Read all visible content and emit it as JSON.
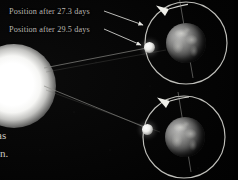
{
  "figure": {
    "name": "moon-sidereal-synodic-month-diagram",
    "background_color": "#050505",
    "labels": {
      "position_27": "Position after 27.3 days",
      "position_29": "Position after 29.5 days"
    },
    "body_text_fragments": {
      "line_1": "as",
      "line_2": "in."
    },
    "objects": {
      "sun_name": "sun",
      "earth_top_name": "earth-upper",
      "earth_bottom_name": "earth-lower",
      "moon_top_name": "moon-upper",
      "moon_bottom_name": "moon-lower",
      "orbit_top_name": "moon-orbit-upper",
      "orbit_bottom_name": "moon-orbit-lower",
      "axis_top_name": "earth-axis-upper",
      "axis_bottom_name": "earth-axis-lower"
    },
    "colors": {
      "sun": "#ffffff",
      "orbit_line": "#d8d8d4",
      "sun_ray": "#9a9a96",
      "label_text": "#b9b7b1",
      "leader_arrow": "#e6e6e2",
      "earth_body": "#6d6d6c"
    },
    "orbit_direction": "counterclockwise"
  }
}
